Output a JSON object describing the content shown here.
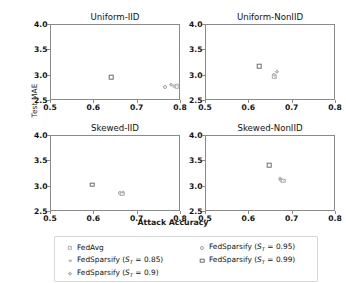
{
  "chart_data": {
    "type": "scatter",
    "title": "",
    "xlabel": "Attack Accuracy",
    "ylabel": "Test MAE",
    "xlim": [
      0.5,
      0.8
    ],
    "ylim": [
      2.5,
      4.0
    ],
    "xticks": [
      "0.5",
      "0.6",
      "0.7",
      "0.8"
    ],
    "yticks": [
      "2.5",
      "3.0",
      "3.5",
      "4.0"
    ],
    "xtick_values": [
      0.5,
      0.6,
      0.7,
      0.8
    ],
    "ytick_values": [
      2.5,
      3.0,
      3.5,
      4.0
    ],
    "grid": false,
    "legend_position": "bottom",
    "legend_ncol": 2,
    "series_names": [
      "FedAvg",
      "FedSparsify (S_T = 0.85)",
      "FedSparsify (S_T = 0.9)",
      "FedSparsify (S_T = 0.95)",
      "FedSparsify (S_T = 0.99)"
    ],
    "subplots": [
      {
        "title": "Uniform-IID",
        "points": [
          {
            "series": "FedSparsify (S_T = 0.99)",
            "x": 0.641,
            "y": 2.95
          },
          {
            "series": "FedSparsify (S_T = 0.95)",
            "x": 0.765,
            "y": 2.76
          },
          {
            "series": "FedSparsify (S_T = 0.9)",
            "x": 0.779,
            "y": 2.79
          },
          {
            "series": "FedSparsify (S_T = 0.85)",
            "x": 0.787,
            "y": 2.77
          },
          {
            "series": "FedAvg",
            "x": 0.793,
            "y": 2.77
          }
        ]
      },
      {
        "title": "Uniform-NonIID",
        "points": [
          {
            "series": "FedSparsify (S_T = 0.99)",
            "x": 0.625,
            "y": 3.17
          },
          {
            "series": "FedSparsify (S_T = 0.95)",
            "x": 0.66,
            "y": 3.0
          },
          {
            "series": "FedSparsify (S_T = 0.9)",
            "x": 0.665,
            "y": 3.05
          },
          {
            "series": "FedSparsify (S_T = 0.85)",
            "x": 0.661,
            "y": 2.94
          },
          {
            "series": "FedAvg",
            "x": 0.66,
            "y": 2.96
          }
        ]
      },
      {
        "title": "Skewed-IID",
        "points": [
          {
            "series": "FedSparsify (S_T = 0.99)",
            "x": 0.598,
            "y": 3.02
          },
          {
            "series": "FedSparsify (S_T = 0.95)",
            "x": 0.661,
            "y": 2.85
          },
          {
            "series": "FedSparsify (S_T = 0.9)",
            "x": 0.668,
            "y": 2.86
          },
          {
            "series": "FedSparsify (S_T = 0.85)",
            "x": 0.665,
            "y": 2.83
          },
          {
            "series": "FedAvg",
            "x": 0.667,
            "y": 2.84
          }
        ]
      },
      {
        "title": "Skewed-NonIID",
        "points": [
          {
            "series": "FedSparsify (S_T = 0.99)",
            "x": 0.648,
            "y": 3.4
          },
          {
            "series": "FedSparsify (S_T = 0.95)",
            "x": 0.675,
            "y": 3.12
          },
          {
            "series": "FedSparsify (S_T = 0.9)",
            "x": 0.674,
            "y": 3.13
          },
          {
            "series": "FedSparsify (S_T = 0.85)",
            "x": 0.682,
            "y": 3.1
          },
          {
            "series": "FedAvg",
            "x": 0.681,
            "y": 3.1
          }
        ]
      }
    ]
  },
  "axes": {
    "xlabel": "Attack Accuracy",
    "ylabel": "Test MAE"
  },
  "legend": {
    "items": [
      {
        "label": "FedAvg",
        "marker": "hatched-square-marker",
        "base": "FedAvg",
        "param": "",
        "value": ""
      },
      {
        "label": "FedSparsify (ST = 0.85)",
        "marker": "tiny-square-marker",
        "base": "FedSparsify (",
        "param": "S",
        "sub": "T",
        "eq": " = 0.85)"
      },
      {
        "label": "FedSparsify (ST = 0.9)",
        "marker": "diamond-marker",
        "base": "FedSparsify (",
        "param": "S",
        "sub": "T",
        "eq": " = 0.9)"
      },
      {
        "label": "FedSparsify (ST = 0.95)",
        "marker": "circle-marker",
        "base": "FedSparsify (",
        "param": "S",
        "sub": "T",
        "eq": " = 0.95)"
      },
      {
        "label": "FedSparsify (ST = 0.99)",
        "marker": "square-marker",
        "base": "FedSparsify (",
        "param": "S",
        "sub": "T",
        "eq": " = 0.99)"
      }
    ]
  }
}
